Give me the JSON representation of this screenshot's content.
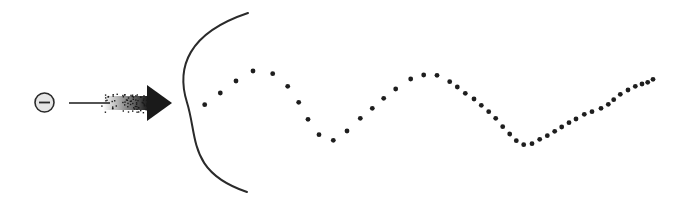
{
  "diagram": {
    "background": "#ffffff",
    "ink": "#1e1e1e",
    "particle": {
      "symbol": "minus",
      "cx": 44.5,
      "cy": 102.5,
      "r": 9.5,
      "fill": "#e6e6e6",
      "stroke": "#2a2a2a"
    },
    "arrow": {
      "line_start": [
        69,
        103
      ],
      "speckle_start_x": 103,
      "shaft_end_x": 148,
      "shaft_top": 96,
      "shaft_bottom": 110,
      "head_base_x": 147,
      "head_tip": [
        172,
        103
      ],
      "head_top": 85,
      "head_bottom": 121,
      "color": "#1a1a1a"
    },
    "boundary_arc": {
      "start": [
        248,
        13
      ],
      "control_left_x": 148,
      "end": [
        247,
        192
      ],
      "stroke": "#2a2a2a",
      "stroke_width": 2
    },
    "trajectory_dots": [
      [
        204.7,
        104.7
      ],
      [
        220.3,
        93
      ],
      [
        236,
        81
      ],
      [
        253,
        71
      ],
      [
        272.7,
        73.7
      ],
      [
        287.7,
        86.3
      ],
      [
        298.7,
        102.3
      ],
      [
        308,
        119.3
      ],
      [
        319,
        134.7
      ],
      [
        333.3,
        140.3
      ],
      [
        347,
        131
      ],
      [
        360.3,
        118.3
      ],
      [
        372.3,
        108.3
      ],
      [
        383.7,
        98.3
      ],
      [
        395.7,
        89
      ],
      [
        410.7,
        79
      ],
      [
        423.7,
        75
      ],
      [
        437,
        75.3
      ],
      [
        449.7,
        81.7
      ],
      [
        457.3,
        87
      ],
      [
        465.3,
        93.3
      ],
      [
        474,
        99
      ],
      [
        481.3,
        105.3
      ],
      [
        488.7,
        111.7
      ],
      [
        495.7,
        118.3
      ],
      [
        502.7,
        126.7
      ],
      [
        509.7,
        134
      ],
      [
        516.3,
        140.7
      ],
      [
        523.7,
        144.7
      ],
      [
        532,
        143.7
      ],
      [
        539.7,
        139.3
      ],
      [
        547.3,
        135.7
      ],
      [
        554.7,
        131.3
      ],
      [
        561.7,
        127
      ],
      [
        569,
        122.7
      ],
      [
        576,
        119
      ],
      [
        584.3,
        114.3
      ],
      [
        592,
        111.7
      ],
      [
        601,
        108.3
      ],
      [
        608.3,
        104.3
      ],
      [
        613.7,
        99.7
      ],
      [
        620.3,
        94.3
      ],
      [
        628,
        90
      ],
      [
        635.3,
        86.3
      ],
      [
        642,
        84
      ],
      [
        647.7,
        82.3
      ],
      [
        653,
        79.3
      ]
    ],
    "dot_radius": 2.4
  }
}
